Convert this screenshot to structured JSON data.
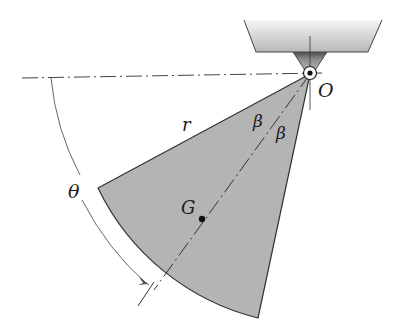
{
  "diagram": {
    "type": "mechanics-sector-pendulum",
    "labels": {
      "pivot": "O",
      "radius": "r",
      "half_angle_left": "β",
      "half_angle_right": "β",
      "center_of_mass": "G",
      "angle": "θ"
    },
    "colors": {
      "sector_fill": "#b4b4b4",
      "support_fill_top": "#f2f2f2",
      "support_fill_bottom": "#bdbdbd",
      "bracket_dark": "#555555",
      "line": "#333333",
      "background": "#ffffff"
    }
  }
}
